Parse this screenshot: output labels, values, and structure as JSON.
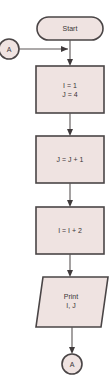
{
  "diagram": {
    "type": "flowchart",
    "colors": {
      "shape_fill": "#efe3e1",
      "shape_stroke": "#4a4546",
      "connector_line": "#5a5555",
      "text": "#3a3536"
    },
    "nodes": [
      {
        "id": "start",
        "shape": "terminal",
        "lines": [
          "Start"
        ]
      },
      {
        "id": "connector_in",
        "shape": "circle-connector",
        "lines": [
          "A"
        ]
      },
      {
        "id": "init",
        "shape": "process",
        "lines": [
          "I = 1",
          "J = 4"
        ]
      },
      {
        "id": "inc_j",
        "shape": "process",
        "lines": [
          "J = J + 1"
        ]
      },
      {
        "id": "inc_i",
        "shape": "process",
        "lines": [
          "I = I + 2"
        ]
      },
      {
        "id": "print",
        "shape": "input-output",
        "lines": [
          "Print",
          "I, J"
        ]
      },
      {
        "id": "connector_out",
        "shape": "circle-connector",
        "lines": [
          "A"
        ]
      }
    ],
    "edges": [
      {
        "from": "start",
        "to": "init"
      },
      {
        "from": "connector_in",
        "to": "init"
      },
      {
        "from": "init",
        "to": "inc_j"
      },
      {
        "from": "inc_j",
        "to": "inc_i"
      },
      {
        "from": "inc_i",
        "to": "print"
      },
      {
        "from": "print",
        "to": "connector_out"
      }
    ]
  }
}
